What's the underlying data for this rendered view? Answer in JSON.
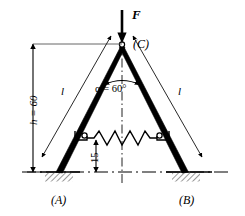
{
  "figure": {
    "labels": {
      "force": "F",
      "apex_joint": "(C)",
      "left_support": "(A)",
      "right_support": "(B)",
      "angle": "α = 60°",
      "left_bar_length": "l",
      "right_bar_length": "l",
      "height_dimension": "h = 60",
      "spring_height_dimension": "15"
    },
    "values": {
      "height_h": 60,
      "spring_height": 15,
      "half_angle_alpha_deg": 60,
      "angle_symbol": "α",
      "degree_symbol": "°",
      "bar_length_symbol": "l",
      "load_symbol": "F"
    },
    "colors": {
      "stroke": "#000000",
      "background": "#ffffff",
      "thin_stroke": "#1a1a1a",
      "hatch": "#333333"
    },
    "icons": {
      "force_arrow": "down-arrow-icon",
      "spring": "coil-spring-icon",
      "pin_joint": "pin-joint-icon",
      "ground_hatch": "ground-hatch-icon",
      "centerline": "center-line-icon",
      "dimension_arrow": "dimension-arrow-icon"
    },
    "geometry": {
      "apex": [
        122,
        44
      ],
      "left_foot": [
        58,
        172
      ],
      "right_foot": [
        186,
        172
      ],
      "spring_left": [
        87,
        138
      ],
      "spring_right": [
        157,
        138
      ],
      "ground_y": 172,
      "dimension_x": 33
    }
  }
}
